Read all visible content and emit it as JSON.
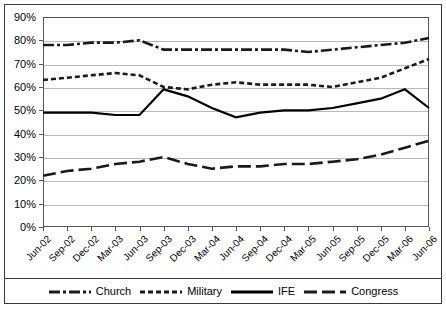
{
  "chart_data": {
    "type": "line",
    "title": "",
    "subtitle": "",
    "xlabel": "",
    "ylabel": "",
    "ylim": [
      0,
      90
    ],
    "ytick_labels": [
      "0%",
      "10%",
      "20%",
      "30%",
      "40%",
      "50%",
      "60%",
      "70%",
      "80%",
      "90%"
    ],
    "ytick_values": [
      0,
      10,
      20,
      30,
      40,
      50,
      60,
      70,
      80,
      90
    ],
    "grid": true,
    "legend_position": "bottom",
    "categories": [
      "Jun-02",
      "Sep-02",
      "Dec-02",
      "Mar-03",
      "Jun-03",
      "Sep-03",
      "Dec-03",
      "Mar-04",
      "Jun-04",
      "Sep-04",
      "Dec-04",
      "Mar-05",
      "Jun-05",
      "Sep-05",
      "Dec-05",
      "Mar-06",
      "Jun-06"
    ],
    "series": [
      {
        "name": "Church",
        "style": "dash-dot",
        "color": "#1a1a1a",
        "values": [
          78,
          78,
          79,
          79,
          80,
          76,
          76,
          76,
          76,
          76,
          76,
          75,
          76,
          77,
          78,
          79,
          81
        ]
      },
      {
        "name": "Military",
        "style": "dotted",
        "color": "#1a1a1a",
        "values": [
          63,
          64,
          65,
          66,
          65,
          60,
          59,
          61,
          62,
          61,
          61,
          61,
          60,
          62,
          64,
          68,
          72
        ]
      },
      {
        "name": "IFE",
        "style": "solid",
        "color": "#000000",
        "values": [
          49,
          49,
          49,
          48,
          48,
          59,
          56,
          51,
          47,
          49,
          50,
          50,
          51,
          53,
          55,
          59,
          51
        ]
      },
      {
        "name": "Congress",
        "style": "long-dash",
        "color": "#1a1a1a",
        "values": [
          22,
          24,
          25,
          27,
          28,
          30,
          27,
          25,
          26,
          26,
          27,
          27,
          28,
          29,
          31,
          34,
          37
        ]
      }
    ]
  },
  "legend": {
    "items": [
      {
        "label": "Church"
      },
      {
        "label": "Military"
      },
      {
        "label": "IFE"
      },
      {
        "label": "Congress"
      }
    ]
  }
}
